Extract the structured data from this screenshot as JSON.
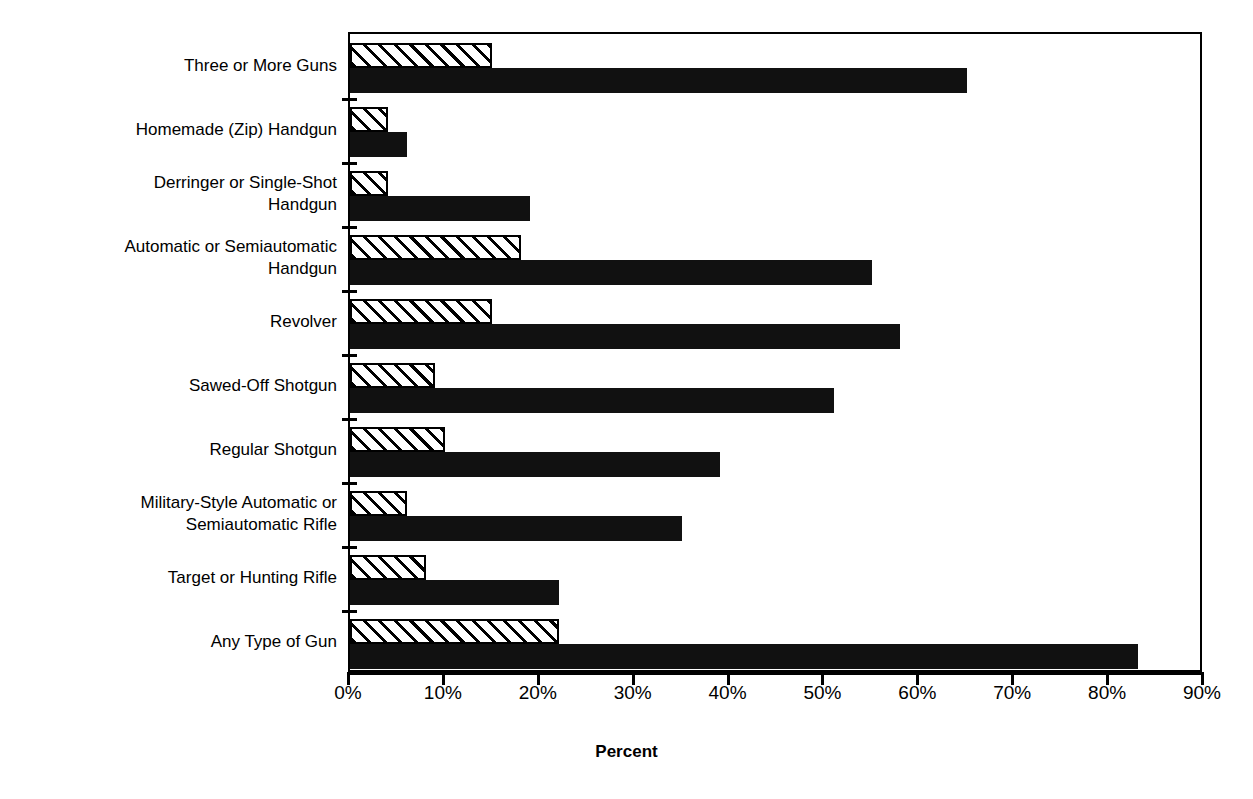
{
  "chart_data": {
    "type": "bar",
    "orientation": "horizontal",
    "title": "",
    "xlabel": "Percent",
    "ylabel": "",
    "xlim": [
      0,
      90
    ],
    "xticks": [
      0,
      10,
      20,
      30,
      40,
      50,
      60,
      70,
      80,
      90
    ],
    "xtick_labels": [
      "0%",
      "10%",
      "20%",
      "30%",
      "40%",
      "50%",
      "60%",
      "70%",
      "80%",
      "90%"
    ],
    "grid": false,
    "legend": "none",
    "categories": [
      "Three or More Guns",
      "Homemade (Zip) Handgun",
      "Derringer or Single-Shot\nHandgun",
      "Automatic or Semiautomatic\nHandgun",
      "Revolver",
      "Sawed-Off Shotgun",
      "Regular Shotgun",
      "Military-Style Automatic or\nSemiautomatic Rifle",
      "Target or Hunting Rifle",
      "Any Type of Gun"
    ],
    "series": [
      {
        "name": "hatched",
        "style": "diagonal-hatch",
        "color": "#ffffff",
        "values": [
          15,
          4,
          4,
          18,
          15,
          9,
          10,
          6,
          8,
          22
        ]
      },
      {
        "name": "solid",
        "style": "solid-fill",
        "color": "#111111",
        "values": [
          65,
          6,
          19,
          55,
          58,
          51,
          39,
          35,
          22,
          83
        ]
      }
    ]
  },
  "axis": {
    "x_title": "Percent"
  }
}
